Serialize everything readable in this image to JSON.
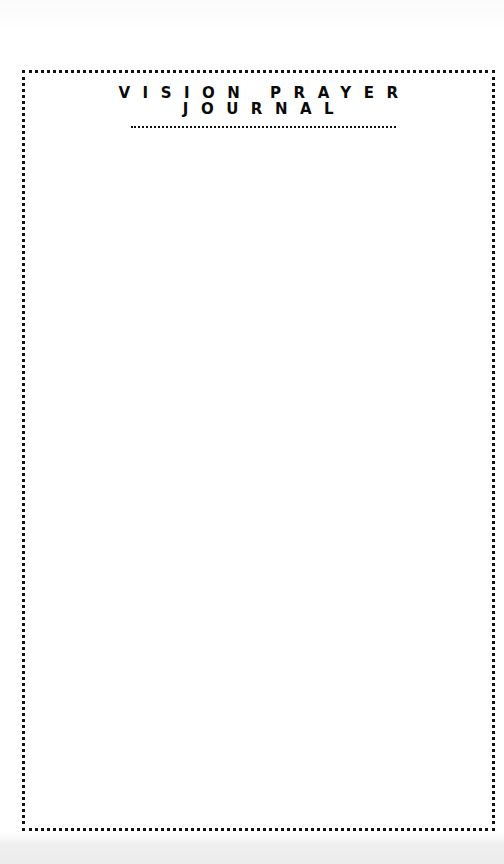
{
  "document": {
    "title_line_1": "VISION PRAYER",
    "title_line_2": "JOURNAL",
    "body_content": ""
  },
  "colors": {
    "ink": "#111111",
    "paper": "#ffffff",
    "bottom_margin": "#ececec"
  }
}
